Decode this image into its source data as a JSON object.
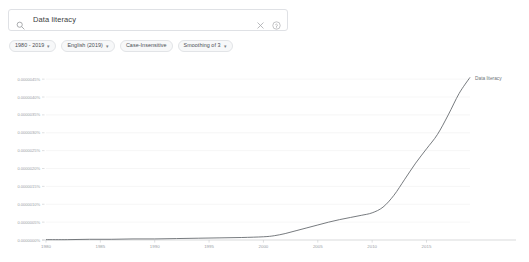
{
  "search": {
    "value": "Data literacy",
    "placeholder": "Search in Google Books",
    "search_icon": "search-icon",
    "clear_icon": "close-icon",
    "help_icon": "help-circle-icon"
  },
  "filters": [
    {
      "label": "1980 - 2019",
      "caret": "▾",
      "has_caret": true
    },
    {
      "label": "English (2019)",
      "caret": "▾",
      "has_caret": true
    },
    {
      "label": "Case-Insensitive",
      "caret": "",
      "has_caret": false
    },
    {
      "label": "Smoothing of 3",
      "caret": "▾",
      "has_caret": true
    }
  ],
  "chart_data": {
    "type": "line",
    "title": "",
    "xlabel": "",
    "ylabel": "",
    "legend_position": "right",
    "grid": true,
    "series_color": "#5f6368",
    "xlim": [
      1980,
      2019
    ],
    "ylim": [
      0,
      4.7e-06
    ],
    "xticks": [
      "1980",
      "1985",
      "1990",
      "1995",
      "2000",
      "2005",
      "2010",
      "2015"
    ],
    "xtick_values": [
      1980,
      1985,
      1990,
      1995,
      2000,
      2005,
      2010,
      2015
    ],
    "yticks": [
      "0.0000045%",
      "0.0000040%",
      "0.0000035%",
      "0.0000030%",
      "0.0000025%",
      "0.0000020%",
      "0.0000015%",
      "0.0000010%",
      "0.0000005%",
      "0.0000000%"
    ],
    "ytick_values": [
      4.5e-06,
      4e-06,
      3.5e-06,
      3e-06,
      2.5e-06,
      2e-06,
      1.5e-06,
      1e-06,
      5e-07,
      0.0
    ],
    "series": [
      {
        "name": "Data literacy",
        "x": [
          1980,
          1982,
          1984,
          1986,
          1988,
          1990,
          1992,
          1994,
          1996,
          1998,
          2000,
          2001,
          2002,
          2003,
          2004,
          2005,
          2006,
          2007,
          2008,
          2009,
          2010,
          2011,
          2012,
          2013,
          2014,
          2015,
          2016,
          2017,
          2018,
          2019
        ],
        "values": [
          1e-08,
          1e-08,
          2e-08,
          2e-08,
          3e-08,
          3e-08,
          4e-08,
          5e-08,
          6e-08,
          7e-08,
          9e-08,
          1.2e-07,
          1.8e-07,
          2.6e-07,
          3.4e-07,
          4.2e-07,
          5e-07,
          5.7e-07,
          6.3e-07,
          6.9e-07,
          7.6e-07,
          9.2e-07,
          1.25e-06,
          1.7e-06,
          2.15e-06,
          2.55e-06,
          2.95e-06,
          3.5e-06,
          4.1e-06,
          4.55e-06
        ]
      }
    ]
  }
}
